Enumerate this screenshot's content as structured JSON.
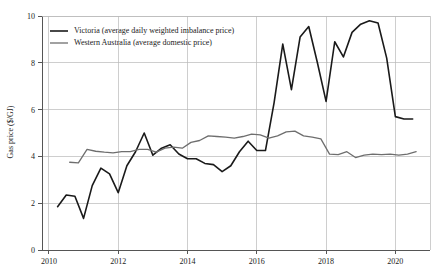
{
  "chart_data": {
    "type": "line",
    "title": "",
    "xlabel": "",
    "ylabel": "Gas price ($/GJ)",
    "xlim": [
      2009.8,
      2021.0
    ],
    "ylim": [
      0,
      10
    ],
    "xticks": [
      2010,
      2012,
      2014,
      2016,
      2018,
      2020
    ],
    "xtick_labels": [
      "2010",
      "2012",
      "2014",
      "2016",
      "2018",
      "2020"
    ],
    "yticks": [
      0,
      2,
      4,
      6,
      8,
      10
    ],
    "ytick_labels": [
      "0",
      "2",
      "4",
      "6",
      "8",
      "10"
    ],
    "grid": "both",
    "legend_position": "top-left",
    "series": [
      {
        "name": "Victoria (average daily weighted imbalance price)",
        "color": "#1a1a1a",
        "width": 1.6,
        "x": [
          2010.25,
          2010.5,
          2010.75,
          2011.0,
          2011.25,
          2011.5,
          2011.75,
          2012.0,
          2012.25,
          2012.5,
          2012.75,
          2013.0,
          2013.25,
          2013.5,
          2013.75,
          2014.0,
          2014.25,
          2014.5,
          2014.75,
          2015.0,
          2015.25,
          2015.5,
          2015.75,
          2016.0,
          2016.25,
          2016.5,
          2016.75,
          2017.0,
          2017.25,
          2017.5,
          2017.75,
          2018.0,
          2018.25,
          2018.5,
          2018.75,
          2019.0,
          2019.25,
          2019.5,
          2019.75,
          2020.0,
          2020.25,
          2020.5
        ],
        "values": [
          1.85,
          2.35,
          2.3,
          1.35,
          2.75,
          3.5,
          3.25,
          2.45,
          3.6,
          4.2,
          5.0,
          4.05,
          4.35,
          4.5,
          4.1,
          3.9,
          3.9,
          3.7,
          3.65,
          3.35,
          3.6,
          4.2,
          4.65,
          4.25,
          4.25,
          6.3,
          8.8,
          6.85,
          9.1,
          9.55,
          8.0,
          6.35,
          8.9,
          8.25,
          9.3,
          9.65,
          9.8,
          9.7,
          8.2,
          5.7,
          5.6,
          5.6
        ]
      },
      {
        "name": "Western Australia (average domestic price)",
        "color": "#6e6e6e",
        "width": 1.3,
        "x": [
          2010.6,
          2010.85,
          2011.1,
          2011.35,
          2011.6,
          2011.85,
          2012.1,
          2012.35,
          2012.6,
          2012.85,
          2013.1,
          2013.35,
          2013.6,
          2013.85,
          2014.1,
          2014.35,
          2014.6,
          2014.85,
          2015.1,
          2015.35,
          2015.6,
          2015.85,
          2016.1,
          2016.35,
          2016.6,
          2016.85,
          2017.1,
          2017.35,
          2017.6,
          2017.85,
          2018.1,
          2018.35,
          2018.6,
          2018.85,
          2019.1,
          2019.35,
          2019.6,
          2019.85,
          2020.1,
          2020.35,
          2020.6
        ],
        "values": [
          3.75,
          3.72,
          4.3,
          4.22,
          4.18,
          4.15,
          4.2,
          4.2,
          4.3,
          4.3,
          4.18,
          4.35,
          4.4,
          4.35,
          4.6,
          4.68,
          4.88,
          4.85,
          4.82,
          4.78,
          4.85,
          4.95,
          4.92,
          4.78,
          4.88,
          5.05,
          5.08,
          4.88,
          4.82,
          4.75,
          4.1,
          4.08,
          4.2,
          3.95,
          4.05,
          4.1,
          4.08,
          4.1,
          4.05,
          4.1,
          4.2
        ]
      }
    ]
  }
}
